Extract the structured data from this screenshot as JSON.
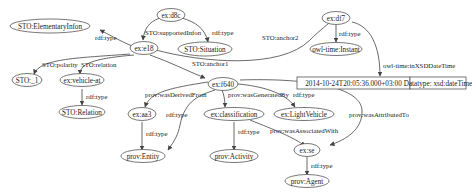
{
  "nodes": {
    "elementary_info": "STO:ElementaryInfon",
    "d8c": "ex:d8c",
    "situation": "STO:Situation",
    "e18": "ex:e18",
    "df7": "ex:df7",
    "instant": "owl-time:Instant",
    "sto_1": "STO:_1",
    "vehicle_at": "ex:vehicle-at",
    "relation": "STO:Relation",
    "f640": "ex:f640",
    "aa3": "ex:aa3",
    "entity": "prov:Entity",
    "classification": "ex:classification",
    "activity": "prov:Activity",
    "light_vehicle": "ex:LightVehicle",
    "se": "ex:se",
    "agent": "prov:Agent"
  },
  "literal": {
    "value": "2014-10-24T20:05:36.000+03:00",
    "datatype": "Datatype: xsd:dateTime"
  },
  "edges": {
    "e18_type": "rdf:type",
    "d8c_supported": "STO:supportedInfon",
    "d8c_type": "rdf:type",
    "e18_anchor2": "STO:anchor2",
    "df7_type": "rdf:type",
    "df7_datetime": "owl-time:inXSDDateTime",
    "e18_polarity": "STO:polarity",
    "e18_relation": "STO:relation",
    "e18_anchor1": "STO:anchor1",
    "vehicle_type": "rdf:type",
    "f640_derived": "prov:wasDerivedFrom",
    "f640_generated": "prov:wasGeneratedBy",
    "f640_type": "rdf:type",
    "f640_attributed": "prov:wasAttributedTo",
    "aa3_type": "rdf:type",
    "f640_type2": "rdf:type",
    "class_type": "rdf:type",
    "class_associated": "prov:wasAssociatedWith",
    "se_type": "rdf:type"
  }
}
